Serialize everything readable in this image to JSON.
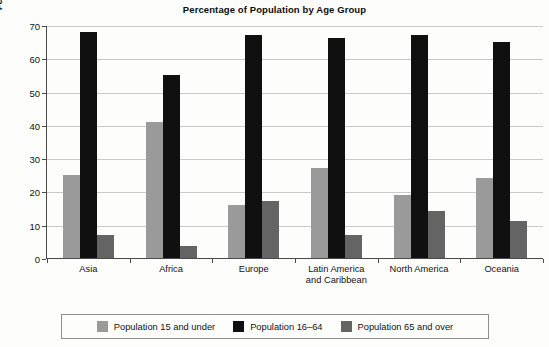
{
  "chart_data": {
    "type": "bar",
    "title": "Percentage of Population by Age Group",
    "xlabel": "",
    "ylabel": "Percentage of Population",
    "ylim": [
      0,
      70
    ],
    "ytick_step": 10,
    "yticks": [
      0,
      10,
      20,
      30,
      40,
      50,
      60,
      70
    ],
    "grid": true,
    "legend_position": "bottom",
    "categories": [
      "Asia",
      "Africa",
      "Europe",
      "Latin America and Caribbean",
      "North America",
      "Oceania"
    ],
    "category_lines": [
      [
        "Asia"
      ],
      [
        "Africa"
      ],
      [
        "Europe"
      ],
      [
        "Latin America",
        "and Caribbean"
      ],
      [
        "North America"
      ],
      [
        "Oceania"
      ]
    ],
    "series": [
      {
        "name": "Population 15 and under",
        "color": "#9a9a9a",
        "values": [
          25,
          41,
          16,
          27,
          19,
          24
        ]
      },
      {
        "name": "Population 16–64",
        "color": "#101010",
        "values": [
          68,
          55,
          67,
          66,
          67,
          65
        ]
      },
      {
        "name": "Population 65 and over",
        "color": "#646464",
        "values": [
          7,
          3.5,
          17,
          7,
          14,
          11
        ]
      }
    ]
  },
  "colors": {
    "background": "#fdfdfc",
    "axis": "#4a4a4a",
    "gridline": "#c9c9c9",
    "text": "#111111",
    "legend_border": "#8d8d8d"
  }
}
